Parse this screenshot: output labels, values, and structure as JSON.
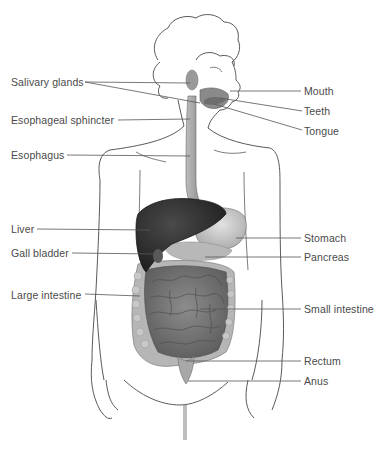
{
  "diagram": {
    "colors": {
      "outline": "#5a5a5a",
      "leader_line": "#555555",
      "label_text": "#4a4a4a",
      "liver": "#2e2e2e",
      "organ_mid": "#8a8a8a",
      "organ_light": "#c4c4c4",
      "intestine": "#7a7a7a",
      "esophagus": "#a8a8a8"
    },
    "labels_left": [
      {
        "id": "salivary-glands",
        "text": "Salivary glands"
      },
      {
        "id": "esophageal-sphincter",
        "text": "Esophageal sphincter"
      },
      {
        "id": "esophagus",
        "text": "Esophagus"
      },
      {
        "id": "liver",
        "text": "Liver"
      },
      {
        "id": "gall-bladder",
        "text": "Gall bladder"
      },
      {
        "id": "large-intestine",
        "text": "Large intestine"
      }
    ],
    "labels_right": [
      {
        "id": "mouth",
        "text": "Mouth"
      },
      {
        "id": "teeth",
        "text": "Teeth"
      },
      {
        "id": "tongue",
        "text": "Tongue"
      },
      {
        "id": "stomach",
        "text": "Stomach"
      },
      {
        "id": "pancreas",
        "text": "Pancreas"
      },
      {
        "id": "small-intestine",
        "text": "Small intestine"
      },
      {
        "id": "rectum",
        "text": "Rectum"
      },
      {
        "id": "anus",
        "text": "Anus"
      }
    ]
  }
}
